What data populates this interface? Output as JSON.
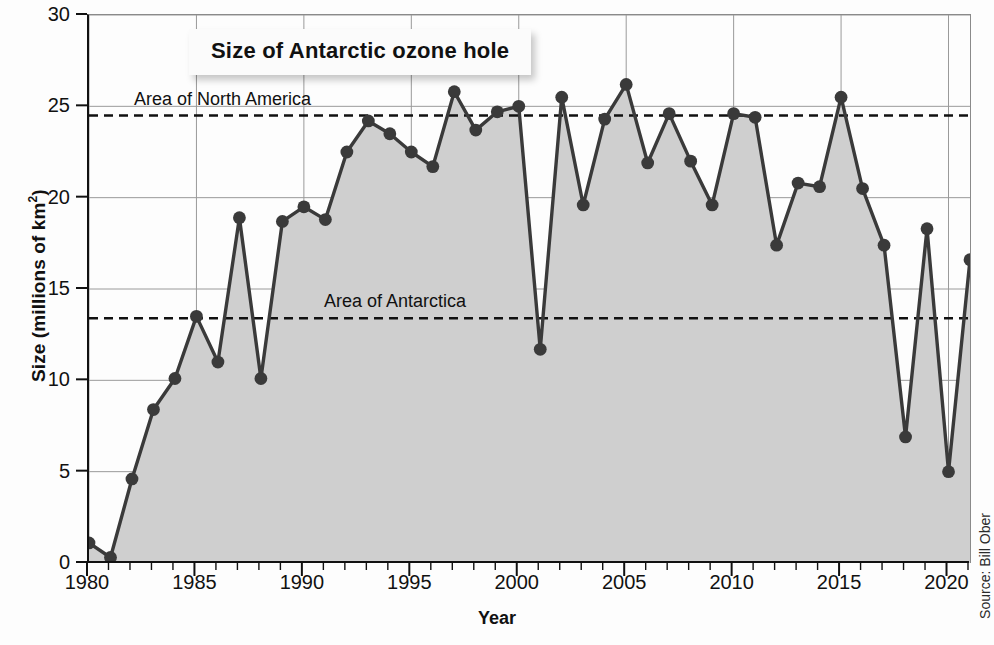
{
  "chart": {
    "title": "Size of Antarctic ozone hole",
    "xlabel": "Year",
    "ylabel_text": "Size (millions of km",
    "ylabel_sup": "2",
    "ylabel_tail": ")",
    "source": "Source: Bill Ober"
  },
  "reference_lines": [
    {
      "label": "Area of North America",
      "value": 24.5
    },
    {
      "label": "Area of Antarctica",
      "value": 13.4
    }
  ],
  "colors": {
    "fill": "#cfcfcf",
    "line": "#3a3a3a",
    "marker": "#3a3a3a",
    "axis": "#111111",
    "grid": "#9a9a9a",
    "background": "#fdfdfd",
    "title_card": "#fbfbfb"
  },
  "chart_data": {
    "type": "area",
    "title": "Size of Antarctic ozone hole",
    "xlabel": "Year",
    "ylabel": "Size (millions of km2)",
    "xlim": [
      1980,
      2021
    ],
    "ylim": [
      0,
      30
    ],
    "ytick_labels": [
      "0",
      "5",
      "10",
      "15",
      "20",
      "25",
      "30"
    ],
    "yticks": [
      0,
      5,
      10,
      15,
      20,
      25,
      30
    ],
    "xtick_labels": [
      "1980",
      "1985",
      "1990",
      "1995",
      "2000",
      "2005",
      "2010",
      "2015",
      "2020"
    ],
    "xticks": [
      1980,
      1985,
      1990,
      1995,
      2000,
      2005,
      2010,
      2015,
      2020
    ],
    "minor_xtick_interval": 1,
    "grid": "both-major",
    "legend": "none",
    "x": [
      1980,
      1981,
      1982,
      1983,
      1984,
      1985,
      1986,
      1987,
      1988,
      1989,
      1990,
      1991,
      1992,
      1993,
      1994,
      1995,
      1996,
      1997,
      1998,
      1999,
      2000,
      2001,
      2002,
      2003,
      2004,
      2005,
      2006,
      2007,
      2008,
      2009,
      2010,
      2011,
      2012,
      2013,
      2014,
      2015,
      2016,
      2017,
      2018,
      2019,
      2020,
      2021
    ],
    "values": [
      1.1,
      0.3,
      4.6,
      8.4,
      10.1,
      13.5,
      11.0,
      18.9,
      10.1,
      18.7,
      19.5,
      18.8,
      22.5,
      24.2,
      23.5,
      22.5,
      21.7,
      25.8,
      23.7,
      24.7,
      25.0,
      11.7,
      25.5,
      19.6,
      24.3,
      26.2,
      21.9,
      24.6,
      22.0,
      19.6,
      24.6,
      24.4,
      17.4,
      20.8,
      20.6,
      25.5,
      20.5,
      17.4,
      6.9,
      18.3,
      5.0,
      16.6
    ],
    "annotations": [
      {
        "text": "Area of North America",
        "y": 24.5,
        "style": "dashed-reference-line"
      },
      {
        "text": "Area of Antarctica",
        "y": 13.4,
        "style": "dashed-reference-line"
      }
    ],
    "series": [
      {
        "name": "Antarctic ozone hole area",
        "values": [
          1.1,
          0.3,
          4.6,
          8.4,
          10.1,
          13.5,
          11.0,
          18.9,
          10.1,
          18.7,
          19.5,
          18.8,
          22.5,
          24.2,
          23.5,
          22.5,
          21.7,
          25.8,
          23.7,
          24.7,
          25.0,
          11.7,
          25.5,
          19.6,
          24.3,
          26.2,
          21.9,
          24.6,
          22.0,
          19.6,
          24.6,
          24.4,
          17.4,
          20.8,
          20.6,
          25.5,
          20.5,
          17.4,
          6.9,
          18.3,
          5.0,
          16.6
        ]
      }
    ]
  }
}
